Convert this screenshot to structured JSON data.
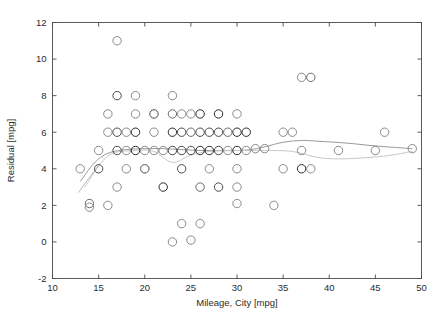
{
  "figure": {
    "background_color": "#ffffff",
    "frame_color": "#4a4a4a",
    "text_color": "#2b2b2b"
  },
  "chart_data": {
    "type": "scatter",
    "title": "",
    "subtitle": "",
    "xlabel": "Mileage, City [mpg]",
    "ylabel": "Residual [mpg]",
    "xlim": [
      10,
      50
    ],
    "ylim": [
      -2,
      12
    ],
    "xticks": [
      10,
      15,
      20,
      25,
      30,
      35,
      40,
      45,
      50
    ],
    "xtick_labels": [
      "10",
      "15",
      "20",
      "25",
      "30",
      "35",
      "40",
      "45",
      "50"
    ],
    "yticks": [
      -2,
      0,
      2,
      4,
      6,
      8,
      10,
      12
    ],
    "ytick_labels": [
      "-2",
      "0",
      "2",
      "4",
      "6",
      "8",
      "10",
      "12"
    ],
    "grid": false,
    "legend": null,
    "legend_position": "none",
    "marker": "open-circle",
    "marker_size": 4.2,
    "marker_edge_color": "#707070",
    "marker_face_color": "none",
    "annotations": [],
    "series": [
      {
        "name": "Residuals",
        "kind": "scatter",
        "points": [
          {
            "x": 13.0,
            "y": 4.0,
            "shade": "#8a8a8a"
          },
          {
            "x": 14.0,
            "y": 2.1,
            "shade": "#6a6a6a"
          },
          {
            "x": 14.0,
            "y": 1.9,
            "shade": "#8a8a8a"
          },
          {
            "x": 15.0,
            "y": 4.0,
            "shade": "#4a4a4a"
          },
          {
            "x": 15.0,
            "y": 5.0,
            "shade": "#8a8a8a"
          },
          {
            "x": 16.0,
            "y": 2.0,
            "shade": "#8a8a8a"
          },
          {
            "x": 16.0,
            "y": 6.0,
            "shade": "#8a8a8a"
          },
          {
            "x": 17.0,
            "y": 11.0,
            "shade": "#8a8a8a"
          },
          {
            "x": 17.0,
            "y": 8.0,
            "shade": "#4a4a4a"
          },
          {
            "x": 17.0,
            "y": 6.0,
            "shade": "#4a4a4a"
          },
          {
            "x": 17.0,
            "y": 5.0,
            "shade": "#4a4a4a"
          },
          {
            "x": 17.0,
            "y": 3.0,
            "shade": "#8a8a8a"
          },
          {
            "x": 16.0,
            "y": 7.0,
            "shade": "#8a8a8a"
          },
          {
            "x": 18.0,
            "y": 6.0,
            "shade": "#8a8a8a"
          },
          {
            "x": 18.0,
            "y": 5.0,
            "shade": "#8a8a8a"
          },
          {
            "x": 18.0,
            "y": 4.0,
            "shade": "#8a8a8a"
          },
          {
            "x": 19.0,
            "y": 8.0,
            "shade": "#8a8a8a"
          },
          {
            "x": 19.0,
            "y": 6.0,
            "shade": "#2a2a2a"
          },
          {
            "x": 19.0,
            "y": 7.0,
            "shade": "#8a8a8a"
          },
          {
            "x": 19.0,
            "y": 5.0,
            "shade": "#2a2a2a"
          },
          {
            "x": 20.0,
            "y": 4.0,
            "shade": "#6a6a6a"
          },
          {
            "x": 20.0,
            "y": 4.0,
            "shade": "#8a8a8a"
          },
          {
            "x": 20.0,
            "y": 5.0,
            "shade": "#8a8a8a"
          },
          {
            "x": 21.0,
            "y": 7.0,
            "shade": "#4a4a4a"
          },
          {
            "x": 21.0,
            "y": 6.0,
            "shade": "#8a8a8a"
          },
          {
            "x": 21.0,
            "y": 5.0,
            "shade": "#8a8a8a"
          },
          {
            "x": 22.0,
            "y": 3.0,
            "shade": "#2a2a2a"
          },
          {
            "x": 22.0,
            "y": 5.0,
            "shade": "#8a8a8a"
          },
          {
            "x": 23.0,
            "y": 8.0,
            "shade": "#8a8a8a"
          },
          {
            "x": 23.0,
            "y": 7.0,
            "shade": "#6a6a6a"
          },
          {
            "x": 23.0,
            "y": 6.0,
            "shade": "#2a2a2a"
          },
          {
            "x": 23.0,
            "y": 5.0,
            "shade": "#4a4a4a"
          },
          {
            "x": 23.0,
            "y": 0.0,
            "shade": "#8a8a8a"
          },
          {
            "x": 24.0,
            "y": 7.0,
            "shade": "#8a8a8a"
          },
          {
            "x": 24.0,
            "y": 6.0,
            "shade": "#4a4a4a"
          },
          {
            "x": 24.0,
            "y": 5.0,
            "shade": "#4a4a4a"
          },
          {
            "x": 24.0,
            "y": 4.0,
            "shade": "#4a4a4a"
          },
          {
            "x": 24.0,
            "y": 1.0,
            "shade": "#8a8a8a"
          },
          {
            "x": 25.0,
            "y": 7.0,
            "shade": "#8a8a8a"
          },
          {
            "x": 25.0,
            "y": 6.0,
            "shade": "#6a6a6a"
          },
          {
            "x": 25.0,
            "y": 5.0,
            "shade": "#4a4a4a"
          },
          {
            "x": 25.0,
            "y": 0.1,
            "shade": "#8a8a8a"
          },
          {
            "x": 26.0,
            "y": 7.0,
            "shade": "#2a2a2a"
          },
          {
            "x": 26.0,
            "y": 6.0,
            "shade": "#4a4a4a"
          },
          {
            "x": 26.0,
            "y": 5.0,
            "shade": "#2a2a2a"
          },
          {
            "x": 26.0,
            "y": 3.0,
            "shade": "#6a6a6a"
          },
          {
            "x": 26.0,
            "y": 1.0,
            "shade": "#8a8a8a"
          },
          {
            "x": 27.0,
            "y": 6.0,
            "shade": "#4a4a4a"
          },
          {
            "x": 27.0,
            "y": 5.0,
            "shade": "#2a2a2a"
          },
          {
            "x": 27.0,
            "y": 4.0,
            "shade": "#8a8a8a"
          },
          {
            "x": 28.0,
            "y": 6.0,
            "shade": "#4a4a4a"
          },
          {
            "x": 28.0,
            "y": 5.0,
            "shade": "#4a4a4a"
          },
          {
            "x": 28.0,
            "y": 7.0,
            "shade": "#2a2a2a"
          },
          {
            "x": 28.0,
            "y": 3.0,
            "shade": "#4a4a4a"
          },
          {
            "x": 29.0,
            "y": 6.0,
            "shade": "#6a6a6a"
          },
          {
            "x": 29.0,
            "y": 5.0,
            "shade": "#8a8a8a"
          },
          {
            "x": 30.0,
            "y": 7.0,
            "shade": "#8a8a8a"
          },
          {
            "x": 30.0,
            "y": 6.0,
            "shade": "#2a2a2a"
          },
          {
            "x": 30.0,
            "y": 5.0,
            "shade": "#2a2a2a"
          },
          {
            "x": 30.0,
            "y": 4.0,
            "shade": "#8a8a8a"
          },
          {
            "x": 30.0,
            "y": 3.0,
            "shade": "#8a8a8a"
          },
          {
            "x": 30.0,
            "y": 2.1,
            "shade": "#8a8a8a"
          },
          {
            "x": 31.0,
            "y": 6.0,
            "shade": "#2a2a2a"
          },
          {
            "x": 31.0,
            "y": 5.0,
            "shade": "#8a8a8a"
          },
          {
            "x": 32.0,
            "y": 5.1,
            "shade": "#8a8a8a"
          },
          {
            "x": 33.0,
            "y": 5.1,
            "shade": "#8a8a8a"
          },
          {
            "x": 34.0,
            "y": 2.0,
            "shade": "#8a8a8a"
          },
          {
            "x": 35.0,
            "y": 4.0,
            "shade": "#8a8a8a"
          },
          {
            "x": 35.0,
            "y": 6.0,
            "shade": "#8a8a8a"
          },
          {
            "x": 37.0,
            "y": 9.0,
            "shade": "#8a8a8a"
          },
          {
            "x": 38.0,
            "y": 9.0,
            "shade": "#6a6a6a"
          },
          {
            "x": 37.0,
            "y": 5.0,
            "shade": "#8a8a8a"
          },
          {
            "x": 37.0,
            "y": 4.0,
            "shade": "#2a2a2a"
          },
          {
            "x": 38.0,
            "y": 4.0,
            "shade": "#8a8a8a"
          },
          {
            "x": 36.0,
            "y": 6.0,
            "shade": "#8a8a8a"
          },
          {
            "x": 41.0,
            "y": 5.0,
            "shade": "#8a8a8a"
          },
          {
            "x": 45.0,
            "y": 5.0,
            "shade": "#8a8a8a"
          },
          {
            "x": 46.0,
            "y": 6.0,
            "shade": "#8a8a8a"
          },
          {
            "x": 49.0,
            "y": 5.1,
            "shade": "#8a8a8a"
          }
        ]
      },
      {
        "name": "Smoothed fit",
        "kind": "line",
        "color": "#9a9a9a",
        "points": [
          {
            "x": 13.0,
            "y": 3.3
          },
          {
            "x": 14.5,
            "y": 4.3
          },
          {
            "x": 16.0,
            "y": 4.85
          },
          {
            "x": 18.0,
            "y": 5.05
          },
          {
            "x": 20.0,
            "y": 5.1
          },
          {
            "x": 22.0,
            "y": 5.1
          },
          {
            "x": 24.0,
            "y": 5.05
          },
          {
            "x": 26.0,
            "y": 5.0
          },
          {
            "x": 28.0,
            "y": 5.0
          },
          {
            "x": 30.0,
            "y": 5.0
          },
          {
            "x": 31.5,
            "y": 5.05
          },
          {
            "x": 33.0,
            "y": 5.2
          },
          {
            "x": 35.0,
            "y": 5.45
          },
          {
            "x": 37.0,
            "y": 5.55
          },
          {
            "x": 39.0,
            "y": 5.5
          },
          {
            "x": 42.0,
            "y": 5.4
          },
          {
            "x": 45.0,
            "y": 5.25
          },
          {
            "x": 49.0,
            "y": 5.1
          }
        ]
      },
      {
        "name": "Secondary fit",
        "kind": "line",
        "color": "#c8c8c8",
        "points": [
          {
            "x": 13.5,
            "y": 3.0
          },
          {
            "x": 16.0,
            "y": 4.7
          },
          {
            "x": 19.0,
            "y": 5.0
          },
          {
            "x": 21.0,
            "y": 4.95
          },
          {
            "x": 23.0,
            "y": 4.35
          },
          {
            "x": 25.0,
            "y": 4.75
          },
          {
            "x": 27.0,
            "y": 4.95
          },
          {
            "x": 30.0,
            "y": 5.0
          },
          {
            "x": 33.0,
            "y": 5.0
          },
          {
            "x": 36.0,
            "y": 4.95
          },
          {
            "x": 39.0,
            "y": 4.6
          },
          {
            "x": 42.0,
            "y": 4.55
          },
          {
            "x": 46.0,
            "y": 4.7
          },
          {
            "x": 49.0,
            "y": 4.95
          }
        ]
      },
      {
        "name": "Short segment",
        "kind": "segment",
        "color": "#b0b0b0",
        "points": [
          {
            "x": 12.8,
            "y": 2.7
          },
          {
            "x": 15.0,
            "y": 4.2
          }
        ]
      }
    ]
  }
}
